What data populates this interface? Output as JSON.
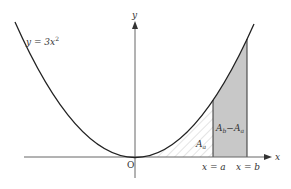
{
  "diagram": {
    "curve_label": "y = 3x",
    "curve_label_exp": "2",
    "y_axis_label": "y",
    "x_axis_label": "x",
    "origin_label": "O",
    "xa_label": "x = a",
    "xb_label": "x = b",
    "area_a_label": "A",
    "area_a_sub": "a",
    "area_diff_label_1": "A",
    "area_diff_sub_1": "b",
    "area_diff_minus": "−",
    "area_diff_label_2": "A",
    "area_diff_sub_2": "a",
    "colors": {
      "curve": "#222222",
      "axes": "#555555",
      "shade": "#c8c8c8",
      "hatch": "#bbbbbb"
    }
  }
}
